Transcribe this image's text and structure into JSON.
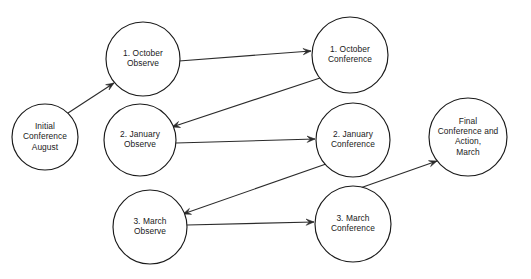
{
  "diagram": {
    "background_color": "#ffffff",
    "node_stroke_color": "#1a1a1a",
    "edge_color": "#2b2b2b",
    "text_color": "#1a1a1a",
    "nodes": [
      {
        "id": "initial",
        "name": "initial-conference-august",
        "lines": [
          "Initial",
          "Conference",
          "August"
        ],
        "cx": 45,
        "cy": 137,
        "r": 33
      },
      {
        "id": "oct_observe",
        "name": "october-observe",
        "lines": [
          "1. October",
          "Observe"
        ],
        "cx": 143,
        "cy": 59,
        "r": 37
      },
      {
        "id": "oct_conference",
        "name": "october-conference",
        "lines": [
          "1. October",
          "Conference"
        ],
        "cx": 350,
        "cy": 55,
        "r": 38
      },
      {
        "id": "jan_observe",
        "name": "january-observe",
        "lines": [
          "2. January",
          "Observe"
        ],
        "cx": 140,
        "cy": 140,
        "r": 36
      },
      {
        "id": "jan_conference",
        "name": "january-conference",
        "lines": [
          "2. January",
          "Conference"
        ],
        "cx": 353,
        "cy": 140,
        "r": 37
      },
      {
        "id": "final",
        "name": "final-conference-and-action-march",
        "lines": [
          "Final",
          "Conference and",
          "Action,",
          "March"
        ],
        "cx": 468,
        "cy": 137,
        "r": 39
      },
      {
        "id": "mar_observe",
        "name": "march-observe",
        "lines": [
          "3. March",
          "Observe"
        ],
        "cx": 150,
        "cy": 227,
        "r": 37
      },
      {
        "id": "mar_conference",
        "name": "march-conference",
        "lines": [
          "3. March",
          "Conference"
        ],
        "cx": 353,
        "cy": 224,
        "r": 38
      }
    ],
    "edges": [
      {
        "name": "edge-initial-to-october-observe",
        "from": "initial",
        "to": "oct_observe",
        "x1": 68,
        "y1": 113,
        "x2": 114,
        "y2": 83
      },
      {
        "name": "edge-october-observe-to-october-conference",
        "from": "oct_observe",
        "to": "oct_conference",
        "x1": 179,
        "y1": 61,
        "x2": 311,
        "y2": 51
      },
      {
        "name": "edge-october-conference-to-january-observe",
        "from": "oct_conference",
        "to": "jan_observe",
        "x1": 320,
        "y1": 78,
        "x2": 172,
        "y2": 127
      },
      {
        "name": "edge-january-observe-to-january-conference",
        "from": "jan_observe",
        "to": "jan_conference",
        "x1": 176,
        "y1": 143,
        "x2": 315,
        "y2": 139
      },
      {
        "name": "edge-january-conference-to-march-observe",
        "from": "jan_conference",
        "to": "mar_observe",
        "x1": 326,
        "y1": 164,
        "x2": 183,
        "y2": 214
      },
      {
        "name": "edge-march-observe-to-march-conference",
        "from": "mar_observe",
        "to": "mar_conference",
        "x1": 187,
        "y1": 225,
        "x2": 314,
        "y2": 222
      },
      {
        "name": "edge-march-conference-to-final",
        "from": "mar_conference",
        "to": "final",
        "x1": 326,
        "y1": 200,
        "x2": 437,
        "y2": 161
      }
    ]
  }
}
